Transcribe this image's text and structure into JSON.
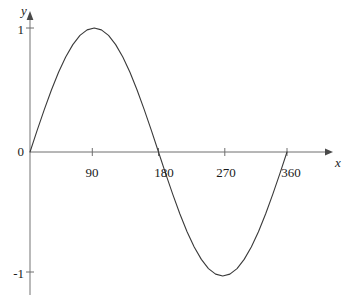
{
  "chart_data": {
    "type": "line",
    "title": "",
    "subtitle": "",
    "xlabel": "x",
    "ylabel": "y",
    "function": "y = sin(x)",
    "grid": false,
    "legend": null,
    "xlim": [
      -18,
      390
    ],
    "ylim": [
      -1.35,
      1.35
    ],
    "x_ticks": [
      90,
      180,
      270,
      360
    ],
    "x_tick_labels": [
      "90",
      "180",
      "270",
      "360"
    ],
    "y_ticks": [
      1,
      0,
      -1
    ],
    "y_tick_labels": [
      "1",
      "0",
      "-1"
    ],
    "series": [
      {
        "name": "y = sin(x)",
        "color": "#3a3a3a",
        "x": [
          0,
          10,
          20,
          30,
          40,
          50,
          60,
          70,
          80,
          90,
          100,
          110,
          120,
          130,
          140,
          150,
          160,
          170,
          180,
          190,
          200,
          210,
          220,
          230,
          240,
          250,
          260,
          270,
          280,
          290,
          300,
          310,
          320,
          330,
          340,
          350,
          360
        ],
        "values": [
          0,
          0.174,
          0.342,
          0.5,
          0.643,
          0.766,
          0.866,
          0.94,
          0.985,
          1,
          0.985,
          0.94,
          0.866,
          0.766,
          0.643,
          0.5,
          0.342,
          0.174,
          0,
          -0.174,
          -0.342,
          -0.5,
          -0.643,
          -0.766,
          -0.866,
          -0.94,
          -0.985,
          -1,
          -0.985,
          -0.94,
          -0.866,
          -0.766,
          -0.643,
          -0.5,
          -0.342,
          -0.174,
          0
        ]
      }
    ],
    "annotations": []
  },
  "axes": {
    "x_axis_label": "x",
    "y_axis_label": "y",
    "origin_label": "0"
  },
  "colors": {
    "curve": "#3a3a3a",
    "axis": "#6e6e6e",
    "text": "#1a1a1a",
    "background": "#ffffff"
  },
  "geometry": {
    "origin_px": {
      "x": 30,
      "y": 152
    },
    "x_unit_px_per_deg": 0.7139,
    "y_unit_px": 124,
    "x_axis_start_px": 30,
    "x_axis_end_px": 332,
    "y_axis_top_px": 12,
    "y_axis_bottom_px": 295
  }
}
